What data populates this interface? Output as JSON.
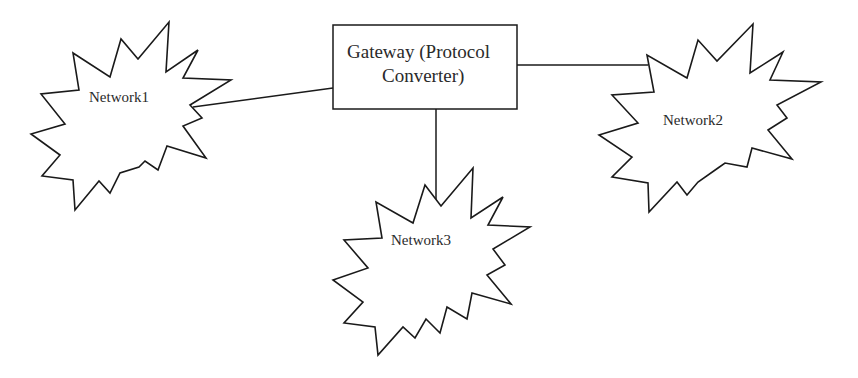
{
  "diagram": {
    "type": "network-topology",
    "gateway": {
      "line1": "Gateway (Protocol",
      "line2": "Converter)"
    },
    "networks": [
      {
        "id": "network1",
        "label": "Network1"
      },
      {
        "id": "network2",
        "label": "Network2"
      },
      {
        "id": "network3",
        "label": "Network3"
      }
    ],
    "connections": [
      {
        "from": "Network1",
        "to": "Gateway (Protocol Converter)"
      },
      {
        "from": "Gateway (Protocol Converter)",
        "to": "Network2"
      },
      {
        "from": "Gateway (Protocol Converter)",
        "to": "Network3"
      }
    ],
    "colors": {
      "stroke": "#1a1a1a",
      "text": "#2a2a2a",
      "background": "#ffffff"
    }
  }
}
